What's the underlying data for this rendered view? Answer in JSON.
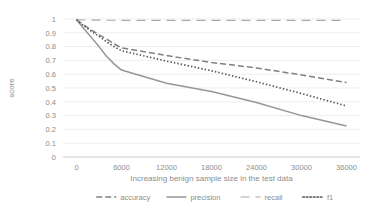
{
  "chart_data": {
    "type": "line",
    "title": "",
    "xlabel": "Increasing benign sample size in the test data",
    "ylabel": "score",
    "x": [
      0,
      1000,
      2000,
      3000,
      4000,
      5000,
      6000,
      12000,
      18000,
      24000,
      30000,
      36000
    ],
    "xlim": [
      -1800,
      37800
    ],
    "ylim": [
      0,
      1
    ],
    "grid": true,
    "legend_position": "bottom",
    "xticks": [
      "0",
      "6000",
      "12000",
      "18000",
      "24000",
      "30000",
      "36000"
    ],
    "xtick_values": [
      0,
      6000,
      12000,
      18000,
      24000,
      30000,
      36000
    ],
    "yticks": [
      "0",
      "0.1",
      "0.2",
      "0.3",
      "0.4",
      "0.5",
      "0.6",
      "0.7",
      "0.8",
      "0.9",
      "1"
    ],
    "ytick_values": [
      0,
      0.1,
      0.2,
      0.3,
      0.4,
      0.5,
      0.6,
      0.7,
      0.8,
      0.9,
      1
    ],
    "series": [
      {
        "name": "accuracy",
        "style": "dashed",
        "color": "#808080",
        "values": [
          0.995,
          0.955,
          0.92,
          0.885,
          0.855,
          0.82,
          0.79,
          0.735,
          0.685,
          0.645,
          0.595,
          0.54
        ]
      },
      {
        "name": "precision",
        "style": "solid",
        "color": "#969696",
        "values": [
          0.995,
          0.93,
          0.865,
          0.8,
          0.73,
          0.675,
          0.63,
          0.535,
          0.475,
          0.395,
          0.3,
          0.225
        ]
      },
      {
        "name": "recall",
        "style": "longdash",
        "color": "#a8a8a8",
        "values": [
          0.995,
          0.993,
          0.992,
          0.992,
          0.991,
          0.991,
          0.99,
          0.99,
          0.99,
          0.99,
          0.99,
          0.99
        ]
      },
      {
        "name": "f1",
        "style": "dotted",
        "color": "#555555",
        "values": [
          0.995,
          0.95,
          0.91,
          0.875,
          0.835,
          0.8,
          0.77,
          0.695,
          0.625,
          0.545,
          0.46,
          0.37
        ]
      }
    ]
  },
  "legend": {
    "items": [
      {
        "label": "accuracy"
      },
      {
        "label": "precision"
      },
      {
        "label": "recall"
      },
      {
        "label": "f1"
      }
    ]
  }
}
